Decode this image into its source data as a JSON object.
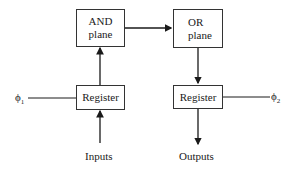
{
  "diagram": {
    "blocks": {
      "and_plane": {
        "line1": "AND",
        "line2": "plane"
      },
      "or_plane": {
        "line1": "OR",
        "line2": "plane"
      },
      "register_in": {
        "label": "Register"
      },
      "register_out": {
        "label": "Register"
      }
    },
    "labels": {
      "phi1": "ϕ",
      "phi1_sub": "1",
      "phi2": "ϕ",
      "phi2_sub": "2",
      "inputs": "Inputs",
      "outputs": "Outputs"
    },
    "connections": [
      {
        "from": "Inputs",
        "to": "register_in"
      },
      {
        "from": "register_in",
        "to": "and_plane"
      },
      {
        "from": "and_plane",
        "to": "or_plane"
      },
      {
        "from": "or_plane",
        "to": "register_out"
      },
      {
        "from": "register_out",
        "to": "Outputs"
      },
      {
        "from": "phi1",
        "to": "register_in"
      },
      {
        "from": "phi2",
        "to": "register_out"
      }
    ]
  }
}
